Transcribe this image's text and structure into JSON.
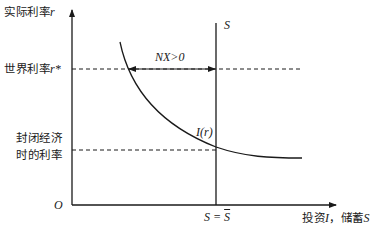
{
  "diagram": {
    "type": "economics-open-economy-saving-investment",
    "y_axis": {
      "label_cn": "实际利率",
      "label_var": "r"
    },
    "x_axis": {
      "label_cn_invest": "投资",
      "var_invest": "I",
      "sep": "，",
      "label_cn_save": "储蓄",
      "var_save": "S"
    },
    "origin": "O",
    "world_rate": {
      "label_cn": "世界利率",
      "label_var": "r*"
    },
    "closed_rate": {
      "line1": "封闭经济",
      "line2": "时的利率"
    },
    "saving_line": {
      "label": "S",
      "bottom_label_left": "S = ",
      "bottom_label_bar": "S"
    },
    "investment_curve": {
      "label": "I(r)"
    },
    "net_exports": {
      "label": "NX>0"
    },
    "colors": {
      "line": "#1a1a1a",
      "background": "#ffffff"
    }
  }
}
